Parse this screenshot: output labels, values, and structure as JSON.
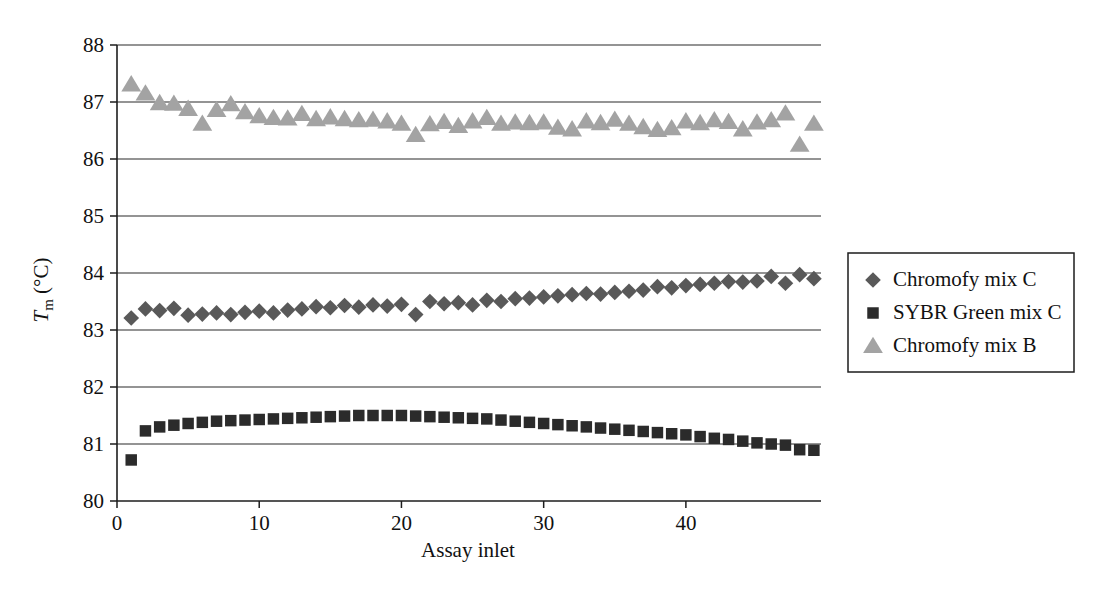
{
  "chart_data": {
    "type": "scatter",
    "title": "",
    "xlabel": "Assay inlet",
    "ylabel": "Tm (°C)",
    "ylabel_parts": {
      "symbol": "T",
      "subscript": "m",
      "unit": "(°C)"
    },
    "xlim": [
      0,
      49.5
    ],
    "ylim": [
      80,
      88
    ],
    "xticks": [
      0,
      10,
      20,
      30,
      40
    ],
    "yticks": [
      80,
      81,
      82,
      83,
      84,
      85,
      86,
      87,
      88
    ],
    "xticklabels": [
      "0",
      "10",
      "20",
      "30",
      "40"
    ],
    "yticklabels": [
      "80",
      "81",
      "82",
      "83",
      "84",
      "85",
      "86",
      "87",
      "88"
    ],
    "grid": true,
    "grid_axis": "y",
    "legend_position": "right",
    "series": [
      {
        "name": "Chromofy mix C",
        "marker": "diamond",
        "color": "#595959",
        "x": [
          1,
          2,
          3,
          4,
          5,
          6,
          7,
          8,
          9,
          10,
          11,
          12,
          13,
          14,
          15,
          16,
          17,
          18,
          19,
          20,
          21,
          22,
          23,
          24,
          25,
          26,
          27,
          28,
          29,
          30,
          31,
          32,
          33,
          34,
          35,
          36,
          37,
          38,
          39,
          40,
          41,
          42,
          43,
          44,
          45,
          46,
          47,
          48,
          49
        ],
        "values": [
          83.21,
          83.37,
          83.34,
          83.38,
          83.26,
          83.28,
          83.3,
          83.27,
          83.31,
          83.33,
          83.3,
          83.35,
          83.37,
          83.41,
          83.39,
          83.43,
          83.4,
          83.44,
          83.42,
          83.45,
          83.27,
          83.5,
          83.46,
          83.48,
          83.44,
          83.52,
          83.5,
          83.55,
          83.56,
          83.58,
          83.6,
          83.62,
          83.64,
          83.63,
          83.66,
          83.68,
          83.7,
          83.76,
          83.74,
          83.78,
          83.8,
          83.82,
          83.85,
          83.84,
          83.86,
          83.94,
          83.82,
          83.97,
          83.9
        ]
      },
      {
        "name": "SYBR Green mix C",
        "marker": "square",
        "color": "#2b2b2b",
        "x": [
          1,
          2,
          3,
          4,
          5,
          6,
          7,
          8,
          9,
          10,
          11,
          12,
          13,
          14,
          15,
          16,
          17,
          18,
          19,
          20,
          21,
          22,
          23,
          24,
          25,
          26,
          27,
          28,
          29,
          30,
          31,
          32,
          33,
          34,
          35,
          36,
          37,
          38,
          39,
          40,
          41,
          42,
          43,
          44,
          45,
          46,
          47,
          48,
          49
        ],
        "values": [
          80.72,
          81.23,
          81.3,
          81.33,
          81.36,
          81.38,
          81.4,
          81.41,
          81.42,
          81.43,
          81.44,
          81.45,
          81.46,
          81.47,
          81.48,
          81.49,
          81.5,
          81.5,
          81.5,
          81.5,
          81.49,
          81.48,
          81.47,
          81.46,
          81.45,
          81.44,
          81.42,
          81.4,
          81.38,
          81.36,
          81.34,
          81.32,
          81.3,
          81.28,
          81.26,
          81.24,
          81.22,
          81.2,
          81.18,
          81.16,
          81.13,
          81.1,
          81.08,
          81.05,
          81.02,
          81.0,
          80.98,
          80.9,
          80.89
        ]
      },
      {
        "name": "Chromofy mix B",
        "marker": "triangle",
        "color": "#a3a3a3",
        "x": [
          1,
          2,
          3,
          4,
          5,
          6,
          7,
          8,
          9,
          10,
          11,
          12,
          13,
          14,
          15,
          16,
          17,
          18,
          19,
          20,
          21,
          22,
          23,
          24,
          25,
          26,
          27,
          28,
          29,
          30,
          31,
          32,
          33,
          34,
          35,
          36,
          37,
          38,
          39,
          40,
          41,
          42,
          43,
          44,
          45,
          46,
          47,
          48,
          49
        ],
        "values": [
          87.31,
          87.15,
          86.98,
          86.97,
          86.88,
          86.62,
          86.86,
          86.96,
          86.82,
          86.75,
          86.72,
          86.71,
          86.79,
          86.7,
          86.73,
          86.7,
          86.68,
          86.69,
          86.66,
          86.62,
          86.42,
          86.61,
          86.65,
          86.58,
          86.66,
          86.72,
          86.62,
          86.64,
          86.63,
          86.64,
          86.55,
          86.52,
          86.66,
          86.63,
          86.69,
          86.62,
          86.56,
          86.51,
          86.54,
          86.66,
          86.63,
          86.68,
          86.65,
          86.52,
          86.64,
          86.68,
          86.8,
          86.25,
          86.62
        ]
      }
    ]
  },
  "legend": {
    "entries": [
      {
        "label": "Chromofy mix C",
        "marker": "diamond",
        "color": "#595959"
      },
      {
        "label": "SYBR Green mix C",
        "marker": "square",
        "color": "#2b2b2b"
      },
      {
        "label": "Chromofy mix B",
        "marker": "triangle",
        "color": "#a3a3a3"
      }
    ]
  }
}
